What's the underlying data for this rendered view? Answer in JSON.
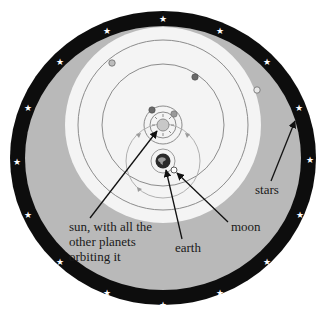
{
  "diagram": {
    "type": "geoheliocentric model (Tychonic system)",
    "colors": {
      "star_ring": "#0d0d0d",
      "sky": "#b9b9b9",
      "inner_disk": "#f4f4f4",
      "orbit_line": "#8c8c8c",
      "star_glyph": "#ffffff",
      "arrow": "#111111",
      "earth": "#2a2a2a",
      "planet_dark": "#6a6a6a",
      "planet_gray": "#9a9a9a",
      "planet_light": "#e8e8e8"
    },
    "labels": {
      "sun_line1": "sun, with all the",
      "sun_line2": "other planets",
      "sun_line3": "orbiting it",
      "earth": "earth",
      "moon": "moon",
      "stars": "stars"
    },
    "elements": {
      "star_ring_star_count": 16,
      "sun_orbiting_planets": 5,
      "sun_orbit_direction_arrows": 3
    }
  }
}
